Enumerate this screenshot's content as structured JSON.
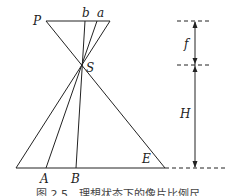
{
  "figure": {
    "labels": {
      "P": "P",
      "b": "b",
      "a": "a",
      "S": "S",
      "A": "A",
      "B": "B",
      "E": "E",
      "f": "f",
      "H": "H"
    },
    "caption": "图 2.5　理想状态下的像片比例尺"
  }
}
